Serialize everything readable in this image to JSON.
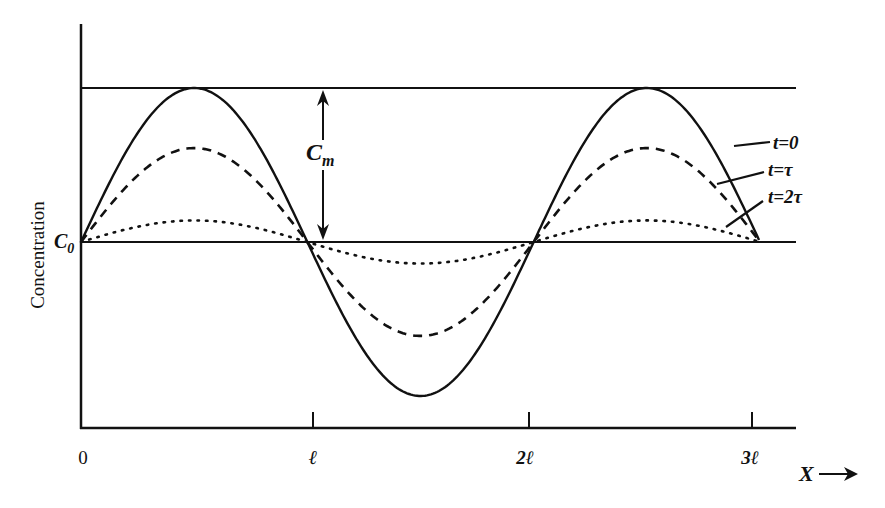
{
  "figure": {
    "ylabel": "Concentration",
    "xlabel": "X",
    "x_arrow": "→",
    "c0_label": "C",
    "c0_sub": "0",
    "cm_label": "C",
    "cm_sub": "m",
    "x_ticks": [
      "0",
      "ℓ",
      "2ℓ",
      "3ℓ"
    ],
    "legend": [
      {
        "label": "t=0",
        "style": "solid"
      },
      {
        "label": "t=τ",
        "style": "dashed"
      },
      {
        "label": "t=2τ",
        "style": "dotted"
      }
    ]
  },
  "chart_data": {
    "type": "line",
    "title": "",
    "xlabel": "X",
    "ylabel": "Concentration",
    "x_ticks": [
      "0",
      "ℓ",
      "2ℓ",
      "3ℓ"
    ],
    "reference_lines": [
      {
        "name": "C0",
        "description": "mean concentration baseline"
      },
      {
        "name": "C0 + Cm",
        "description": "initial maximum concentration"
      }
    ],
    "annotations": [
      "Cm (double arrow between C0 line and upper line)"
    ],
    "series": [
      {
        "name": "t=0",
        "style": "solid",
        "relative_amplitude": 1.0,
        "shape": "C0 + Cm·sin(πx/ℓ), x from 0 to 3ℓ"
      },
      {
        "name": "t=τ",
        "style": "dashed",
        "relative_amplitude": 0.61,
        "shape": "decayed sinusoid"
      },
      {
        "name": "t=2τ",
        "style": "dotted",
        "relative_amplitude": 0.14,
        "shape": "further decayed sinusoid"
      }
    ],
    "xlim": [
      0,
      "3ℓ"
    ],
    "grid": false
  }
}
